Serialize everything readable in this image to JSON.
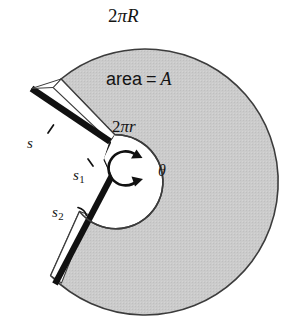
{
  "figure": {
    "kind": "annulus-unrolling-diagram",
    "width": 291,
    "height": 326,
    "background_color": "#ffffff"
  },
  "labels": {
    "outer_circumference": {
      "text": "2πR",
      "number": "2",
      "pi": "π",
      "variable": "R"
    },
    "area": {
      "text": "area = A",
      "word": "area",
      "equals": "=",
      "variable": "A"
    },
    "inner_circumference": {
      "text": "2πr",
      "number": "2",
      "pi": "π",
      "variable": "r"
    },
    "angle": {
      "text": "θ",
      "name": "theta"
    },
    "arc_s": {
      "text": "s",
      "variable": "s"
    },
    "arc_s1": {
      "text": "s1",
      "variable": "s",
      "subscript": "1"
    },
    "arc_s2": {
      "text": "s2",
      "variable": "s",
      "subscript": "2"
    }
  },
  "geometry": {
    "outer_circle": {
      "cx": 155,
      "cy": 173,
      "r": 133,
      "fill": "#c8c8c8",
      "stroke": "#3c3c3c"
    },
    "inner_circle": {
      "cx": 148,
      "cy": 168,
      "r": 47,
      "fill": "#ffffff",
      "stroke": "#3c3c3c"
    },
    "cut_wedge": {
      "start_angle_deg": 135,
      "end_angle_deg": 218
    },
    "theta_arc": {
      "cx": 150,
      "cy": 168,
      "r": 16,
      "stroke": "#111111"
    }
  },
  "colors": {
    "annulus_gray": "#c8c8c8",
    "outline": "#3c3c3c",
    "thick_edge_black": "#111111",
    "text": "#141414",
    "paper_white": "#ffffff"
  }
}
